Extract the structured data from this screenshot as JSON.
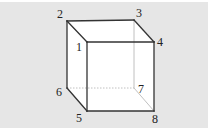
{
  "diagram": {
    "type": "cube",
    "background_color": "#e6e6e6",
    "face_color": "#ffffff",
    "edge_color": "#333333",
    "hidden_edge_color": "#b0b0b0",
    "vertices": [
      {
        "id": "1",
        "label": "1",
        "x": 87,
        "y": 42,
        "lx": 76,
        "ly": 51
      },
      {
        "id": "2",
        "label": "2",
        "x": 67,
        "y": 21,
        "lx": 57,
        "ly": 18
      },
      {
        "id": "3",
        "label": "3",
        "x": 134,
        "y": 20,
        "lx": 136,
        "ly": 17
      },
      {
        "id": "4",
        "label": "4",
        "x": 154,
        "y": 42,
        "lx": 157,
        "ly": 46
      },
      {
        "id": "5",
        "label": "5",
        "x": 87,
        "y": 111,
        "lx": 76,
        "ly": 122
      },
      {
        "id": "6",
        "label": "6",
        "x": 67,
        "y": 88,
        "lx": 56,
        "ly": 96
      },
      {
        "id": "7",
        "label": "7",
        "x": 134,
        "y": 88,
        "lx": 138,
        "ly": 93
      },
      {
        "id": "8",
        "label": "8",
        "x": 154,
        "y": 111,
        "lx": 152,
        "ly": 123
      }
    ],
    "visible_edges": [
      [
        "1",
        "2"
      ],
      [
        "2",
        "3"
      ],
      [
        "3",
        "4"
      ],
      [
        "4",
        "1"
      ],
      [
        "1",
        "5"
      ],
      [
        "4",
        "8"
      ],
      [
        "5",
        "8"
      ],
      [
        "2",
        "6"
      ],
      [
        "6",
        "5"
      ]
    ],
    "hidden_edges": [
      [
        "3",
        "7"
      ],
      [
        "6",
        "7"
      ],
      [
        "7",
        "8"
      ]
    ]
  }
}
